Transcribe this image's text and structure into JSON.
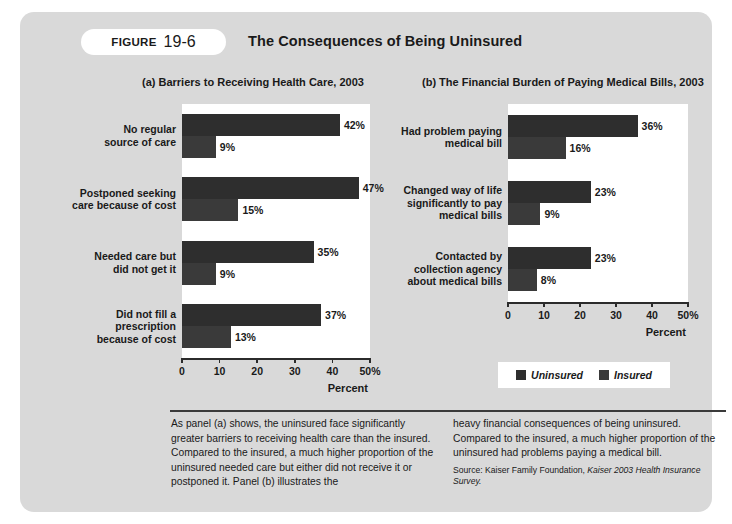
{
  "figure": {
    "tab_word": "FIGURE",
    "tab_number": "19-6",
    "title": "The Consequences of Being Uninsured"
  },
  "legend": {
    "items": [
      {
        "label": "Uninsured",
        "color": "#2e2e2e"
      },
      {
        "label": "Insured",
        "color": "#3a3a3a"
      }
    ]
  },
  "caption": {
    "left": "As panel (a) shows, the uninsured face significantly greater barriers to receiving health care than the insured. Compared to the insured, a much higher proportion of the uninsured needed care but either did not receive it or postponed it. Panel (b) illustrates the",
    "right": "heavy financial consequences of being uninsured. Compared to the insured, a much higher proportion of the uninsured had problems paying a medical bill.",
    "source_prefix": "Source: Kaiser Family Foundation, ",
    "source_italic": "Kaiser 2003 Health Insurance Survey."
  },
  "chart_data": [
    {
      "type": "bar",
      "orientation": "horizontal",
      "id": "panel-a",
      "title": "(a) Barriers to Receiving Health Care, 2003",
      "xlabel": "Percent",
      "ylabel": "",
      "xlim": [
        0,
        50
      ],
      "grid": false,
      "legend_position": "below-center",
      "ticks": [
        "0",
        "10",
        "20",
        "30",
        "40",
        "50%"
      ],
      "tick_values": [
        0,
        10,
        20,
        30,
        40,
        50
      ],
      "categories": [
        "No regular\nsource of care",
        "Postponed seeking\ncare because of cost",
        "Needed care but\ndid not get it",
        "Did not fill a\nprescription\nbecause of cost"
      ],
      "category_lines": [
        [
          "No regular",
          "source of care"
        ],
        [
          "Postponed seeking",
          "care because of cost"
        ],
        [
          "Needed care but",
          "did not get it"
        ],
        [
          "Did not fill a",
          "prescription",
          "because of cost"
        ]
      ],
      "series": [
        {
          "name": "Uninsured",
          "values": [
            42,
            47,
            35,
            37
          ],
          "labels": [
            "42%",
            "47%",
            "35%",
            "37%"
          ]
        },
        {
          "name": "Insured",
          "values": [
            9,
            15,
            9,
            13
          ],
          "labels": [
            "9%",
            "15%",
            "9%",
            "13%"
          ]
        }
      ]
    },
    {
      "type": "bar",
      "orientation": "horizontal",
      "id": "panel-b",
      "title": "(b) The Financial Burden of Paying Medical Bills, 2003",
      "xlabel": "Percent",
      "ylabel": "",
      "xlim": [
        0,
        50
      ],
      "grid": false,
      "legend_position": "below-center",
      "ticks": [
        "0",
        "10",
        "20",
        "30",
        "40",
        "50%"
      ],
      "tick_values": [
        0,
        10,
        20,
        30,
        40,
        50
      ],
      "categories": [
        "Had problem paying\nmedical bill",
        "Changed way of life\nsignificantly to pay\nmedical bills",
        "Contacted by\ncollection agency\nabout medical bills"
      ],
      "category_lines": [
        [
          "Had problem paying",
          "medical bill"
        ],
        [
          "Changed way of life",
          "significantly to pay",
          "medical bills"
        ],
        [
          "Contacted by",
          "collection agency",
          "about medical bills"
        ]
      ],
      "series": [
        {
          "name": "Uninsured",
          "values": [
            36,
            23,
            23
          ],
          "labels": [
            "36%",
            "23%",
            "23%"
          ]
        },
        {
          "name": "Insured",
          "values": [
            16,
            9,
            8
          ],
          "labels": [
            "16%",
            "9%",
            "8%"
          ]
        }
      ]
    }
  ]
}
